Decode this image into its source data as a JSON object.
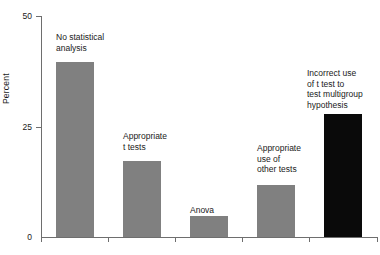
{
  "chart_data": {
    "type": "bar",
    "title": "",
    "subtitle": "",
    "xlabel": "",
    "ylabel": "Percent",
    "ylim": [
      0,
      50
    ],
    "yticks": [
      0,
      25,
      50
    ],
    "ytick_labels": [
      "0",
      "25",
      "50"
    ],
    "grid": false,
    "legend": null,
    "categories": [
      "No statistical analysis",
      "Appropriate t tests",
      "Anova",
      "Appropriate use of other tests",
      "Incorrect use of t test to test multigroup hypothesis"
    ],
    "values": [
      39.5,
      17.2,
      4.8,
      11.8,
      27.8
    ],
    "bar_colors": [
      "#808080",
      "#808080",
      "#808080",
      "#808080",
      "#0a0a0a"
    ],
    "annotations": [
      {
        "text": "No statistical\nanalysis"
      },
      {
        "text": "Appropriate\nt tests"
      },
      {
        "text": "Anova"
      },
      {
        "text": "Appropriate\nuse of\nother tests"
      },
      {
        "text": "Incorrect use\nof t test to\ntest multigroup\nhypothesis"
      }
    ]
  },
  "axis": {
    "y_title": "Percent",
    "y_tick_50": "50",
    "y_tick_25": "25",
    "y_tick_0": "0"
  },
  "colors": {
    "bar_gray": "#808080",
    "bar_black": "#0a0a0a",
    "axis": "#6e6e6e",
    "text": "#1a1a1a",
    "background": "#ffffff"
  }
}
